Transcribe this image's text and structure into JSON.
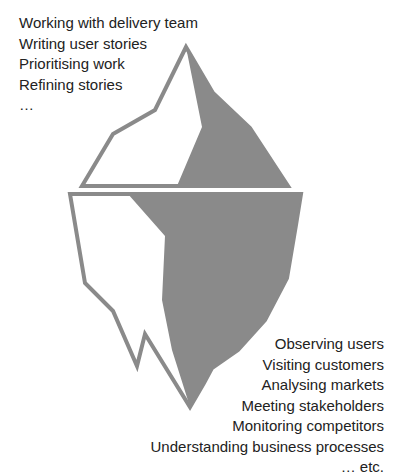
{
  "diagram": {
    "type": "iceberg",
    "colors": {
      "outline": "#8a8a8a",
      "shaded": "#8a8a8a",
      "background": "#ffffff",
      "text": "#222222"
    }
  },
  "above_water": {
    "items": [
      "Working with delivery team",
      "Writing user stories",
      "Prioritising work",
      "Refining stories",
      "…"
    ]
  },
  "below_water": {
    "items": [
      "Observing users",
      "Visiting customers",
      "Analysing markets",
      "Meeting stakeholders",
      "Monitoring competitors",
      "Understanding business processes",
      "… etc."
    ]
  }
}
